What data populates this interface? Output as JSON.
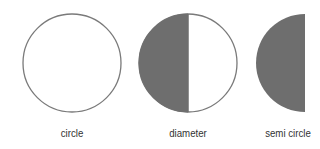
{
  "figures": [
    {
      "label": "circle",
      "type": "circle",
      "cx": 72,
      "cy": 63,
      "r": 49,
      "label_x": 72
    },
    {
      "label": "diameter",
      "type": "half-filled-circle",
      "cx": 188,
      "cy": 63,
      "r": 49,
      "label_x": 188
    },
    {
      "label": "semi circle",
      "type": "semicircle",
      "cx": 305,
      "cy": 63,
      "r": 49,
      "label_x": 288
    }
  ],
  "colors": {
    "stroke": "#7a7a7a",
    "fill": "#6e6e6e",
    "text": "#333333",
    "background": "#ffffff"
  }
}
